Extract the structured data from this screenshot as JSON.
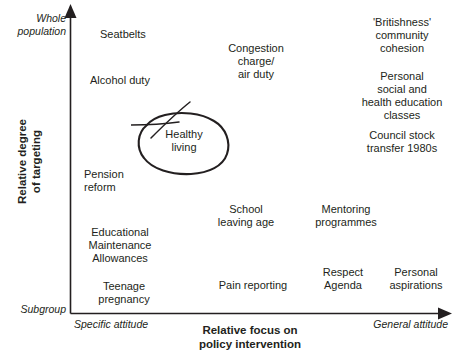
{
  "figure": {
    "background_color": "#ffffff",
    "ink_color": "#231f20",
    "clipped_title": "Figure 1: Mapping of policy interventions"
  },
  "axes": {
    "y": {
      "title": "Relative degree\nof targeting",
      "high_label": "Whole\npopulation",
      "low_label": "Subgroup",
      "arrow_direction": "up"
    },
    "x": {
      "title": "Relative focus on\npolicy intervention",
      "low_label": "Specific attitude",
      "high_label": "General attitude",
      "arrow_direction": "right"
    }
  },
  "annotation": {
    "shape": "hand-drawn-ellipse-with-strikethrough-line",
    "target": "Healthy living"
  },
  "chart_data": {
    "type": "scatter",
    "title": "Mapping of policy interventions",
    "xlabel": "Relative focus on policy intervention",
    "ylabel": "Relative degree of targeting",
    "xlim": [
      "Specific attitude",
      "General attitude"
    ],
    "ylim": [
      "Subgroup",
      "Whole population"
    ],
    "grid": false,
    "legend": "none",
    "points": [
      {
        "label": "Seatbelts",
        "x": 0.11,
        "y": 0.94,
        "px": 100,
        "py": 28,
        "align": "left",
        "width": 80
      },
      {
        "label": "Congestion\ncharge/\nair duty",
        "x": 0.42,
        "y": 0.87,
        "px": 218,
        "py": 42,
        "align": "center",
        "width": 76
      },
      {
        "label": "'Britishness'\ncommunity\ncohesion",
        "x": 0.84,
        "y": 0.94,
        "px": 350,
        "py": 16,
        "align": "center",
        "width": 104
      },
      {
        "label": "Alcohol duty",
        "x": 0.09,
        "y": 0.78,
        "px": 90,
        "py": 74,
        "align": "left",
        "width": 90
      },
      {
        "label": "Personal\nsocial and\nhealth education\nclasses",
        "x": 0.84,
        "y": 0.76,
        "px": 348,
        "py": 70,
        "align": "center",
        "width": 108
      },
      {
        "label": "Healthy\nliving",
        "x": 0.27,
        "y": 0.6,
        "px": 155,
        "py": 128,
        "align": "center",
        "width": 58
      },
      {
        "label": "Council stock\ntransfer 1980s",
        "x": 0.84,
        "y": 0.58,
        "px": 348,
        "py": 129,
        "align": "center",
        "width": 108
      },
      {
        "label": "Pension\nreform",
        "x": 0.08,
        "y": 0.48,
        "px": 84,
        "py": 168,
        "align": "left",
        "width": 78
      },
      {
        "label": "School\nleaving age",
        "x": 0.4,
        "y": 0.37,
        "px": 205,
        "py": 203,
        "align": "center",
        "width": 82
      },
      {
        "label": "Mentoring\nprogrammes",
        "x": 0.61,
        "y": 0.37,
        "px": 300,
        "py": 203,
        "align": "center",
        "width": 92
      },
      {
        "label": "Educational\nMaintenance\nAllowances",
        "x": 0.07,
        "y": 0.26,
        "px": 74,
        "py": 226,
        "align": "center",
        "width": 92
      },
      {
        "label": "Pain reporting",
        "x": 0.4,
        "y": 0.12,
        "px": 207,
        "py": 279,
        "align": "center",
        "width": 92
      },
      {
        "label": "Respect\nAgenda",
        "x": 0.62,
        "y": 0.14,
        "px": 308,
        "py": 266,
        "align": "center",
        "width": 70
      },
      {
        "label": "Personal\naspirations",
        "x": 0.85,
        "y": 0.14,
        "px": 374,
        "py": 266,
        "align": "center",
        "width": 84
      },
      {
        "label": "Teenage\npregnancy",
        "x": 0.09,
        "y": 0.09,
        "px": 80,
        "py": 280,
        "align": "center",
        "width": 88
      }
    ]
  }
}
